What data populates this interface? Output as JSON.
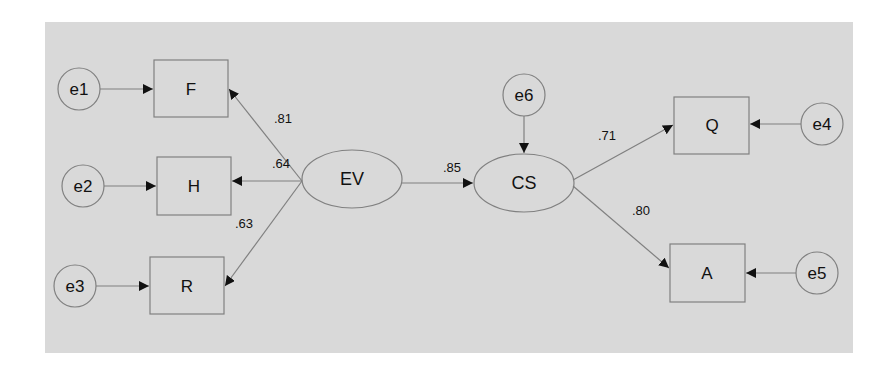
{
  "diagram": {
    "type": "structural-equation-model",
    "colors": {
      "background": "#d9d9d9",
      "stroke": "#808080",
      "text": "#111111"
    },
    "error_terms": [
      {
        "id": "e1",
        "label": "e1",
        "cx": 79,
        "cy": 89
      },
      {
        "id": "e2",
        "label": "e2",
        "cx": 83,
        "cy": 186
      },
      {
        "id": "e3",
        "label": "e3",
        "cx": 75,
        "cy": 286
      },
      {
        "id": "e4",
        "label": "e4",
        "cx": 822,
        "cy": 124
      },
      {
        "id": "e5",
        "label": "e5",
        "cx": 817,
        "cy": 273
      },
      {
        "id": "e6",
        "label": "e6",
        "cx": 524,
        "cy": 95
      }
    ],
    "observed": [
      {
        "id": "F",
        "label": "F",
        "x": 154,
        "y": 60,
        "w": 74,
        "h": 57
      },
      {
        "id": "H",
        "label": "H",
        "x": 157,
        "y": 157,
        "w": 74,
        "h": 58
      },
      {
        "id": "R",
        "label": "R",
        "x": 150,
        "y": 257,
        "w": 74,
        "h": 57
      },
      {
        "id": "Q",
        "label": "Q",
        "x": 674,
        "y": 97,
        "w": 75,
        "h": 57
      },
      {
        "id": "A",
        "label": "A",
        "x": 670,
        "y": 244,
        "w": 75,
        "h": 58
      }
    ],
    "latent": [
      {
        "id": "EV",
        "label": "EV",
        "cx": 352,
        "cy": 179,
        "rx": 50,
        "ry": 29
      },
      {
        "id": "CS",
        "label": "CS",
        "cx": 524,
        "cy": 183,
        "rx": 50,
        "ry": 29
      }
    ],
    "paths": [
      {
        "from": "EV",
        "to": "F",
        "coef": ".81",
        "label_x": 283,
        "label_y": 118
      },
      {
        "from": "EV",
        "to": "H",
        "coef": ".64",
        "label_x": 281,
        "label_y": 163
      },
      {
        "from": "EV",
        "to": "R",
        "coef": ".63",
        "label_x": 244,
        "label_y": 223
      },
      {
        "from": "EV",
        "to": "CS",
        "coef": ".85",
        "label_x": 452,
        "label_y": 167
      },
      {
        "from": "CS",
        "to": "Q",
        "coef": ".71",
        "label_x": 607,
        "label_y": 135
      },
      {
        "from": "CS",
        "to": "A",
        "coef": ".80",
        "label_x": 641,
        "label_y": 210
      }
    ],
    "coefficients": {
      "ev_f": ".81",
      "ev_h": ".64",
      "ev_r": ".63",
      "ev_cs": ".85",
      "cs_q": ".71",
      "cs_a": ".80"
    },
    "labels": {
      "e1": "e1",
      "e2": "e2",
      "e3": "e3",
      "e4": "e4",
      "e5": "e5",
      "e6": "e6",
      "F": "F",
      "H": "H",
      "R": "R",
      "Q": "Q",
      "A": "A",
      "EV": "EV",
      "CS": "CS"
    }
  }
}
